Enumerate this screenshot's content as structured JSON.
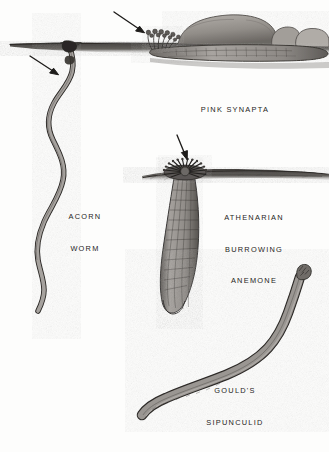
{
  "plate": {
    "medium": "ink and wash natural history illustration",
    "background_color": "#fdfdfc",
    "ink_color": "#2b2826",
    "sediment_color": "#4a4745",
    "body_color": "#9c9894"
  },
  "labels": {
    "synapta": {
      "lines": [
        "PINK SYNAPTA"
      ]
    },
    "acorn_worm": {
      "lines": [
        "ACORN",
        "WORM"
      ]
    },
    "anemone": {
      "lines": [
        "ATHENARIAN",
        "BURROWING",
        "ANEMONE"
      ]
    },
    "sipunculid": {
      "lines": [
        "GOULD'S",
        "SIPUNCULID"
      ]
    }
  },
  "figures": [
    {
      "name": "pink-synapta",
      "description": "elongate sea cucumber lying along the seafloor beneath rocks with a tentacle tuft at its anterior end",
      "label": "PINK SYNAPTA"
    },
    {
      "name": "acorn-worm",
      "description": "long sinuous S-curved worm descending from a funnel-shaped burrow opening at the sediment surface",
      "label": "ACORN WORM"
    },
    {
      "name": "athenarian-burrowing-anemone",
      "description": "anemone with a radiating crown of tentacles at the sediment surface above a striated buried column",
      "label": "ATHENARIAN BURROWING ANEMONE"
    },
    {
      "name": "goulds-sipunculid",
      "description": "J-shaped peanut worm with a ruffled introvert tip at the upper end and a blunt trunk curving to the lower left",
      "label": "GOULD'S SIPUNCULID"
    }
  ],
  "pointer_arrows": [
    {
      "name": "arrow-to-synapta-tentacles",
      "points_to": "pink synapta tentacle tuft",
      "direction": "down-right"
    },
    {
      "name": "arrow-to-acorn-worm-collar",
      "points_to": "acorn worm collar",
      "direction": "down-right"
    },
    {
      "name": "arrow-to-anemone-tentacles",
      "points_to": "anemone tentacle crown",
      "direction": "down-right"
    }
  ]
}
